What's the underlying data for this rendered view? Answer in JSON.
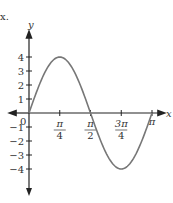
{
  "chart_data": {
    "type": "line",
    "title": "",
    "function": "y = 4 sin(2x)",
    "xlabel": "x",
    "ylabel": "y",
    "xlim": [
      0,
      3.1416
    ],
    "ylim": [
      -4,
      4
    ],
    "x_ticks": [
      "π/4",
      "π/2",
      "3π/4",
      "π"
    ],
    "y_ticks": [
      "4",
      "3",
      "2",
      "1",
      "0",
      "-1",
      "-2",
      "-3",
      "-4"
    ],
    "grid": false,
    "series": [
      {
        "name": "4 sin 2x",
        "x": [
          0,
          0.3927,
          0.7854,
          1.1781,
          1.5708,
          1.9635,
          2.3562,
          2.7489,
          3.1416
        ],
        "y": [
          0,
          2.83,
          4,
          2.83,
          0,
          -2.83,
          -4,
          -2.83,
          0
        ]
      }
    ]
  },
  "labels": {
    "x_axis": "x",
    "y_axis": "y",
    "origin": "0",
    "corner_mark": "x."
  }
}
